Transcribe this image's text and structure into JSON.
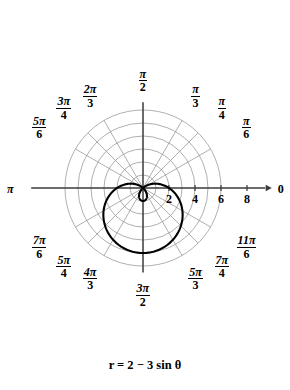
{
  "figure": {
    "caption": "r = 2 − 3 sin θ",
    "axis_right_label": "0",
    "axis_left_label": "π"
  },
  "radial_ticks": [
    {
      "value": 2,
      "label": "2"
    },
    {
      "value": 4,
      "label": "4"
    },
    {
      "value": 6,
      "label": "6"
    },
    {
      "value": 8,
      "label": "8"
    }
  ],
  "angle_labels": [
    {
      "id": "pi-over-2",
      "num": "π",
      "den": "2",
      "degrees": 90
    },
    {
      "id": "two-pi-over-3",
      "num": "2π",
      "den": "3",
      "degrees": 120
    },
    {
      "id": "three-pi-over-4",
      "num": "3π",
      "den": "4",
      "degrees": 135
    },
    {
      "id": "five-pi-over-6",
      "num": "5π",
      "den": "6",
      "degrees": 150
    },
    {
      "id": "pi",
      "num": "π",
      "den": "",
      "degrees": 180
    },
    {
      "id": "seven-pi-over-6",
      "num": "7π",
      "den": "6",
      "degrees": 210
    },
    {
      "id": "five-pi-over-4",
      "num": "5π",
      "den": "4",
      "degrees": 225
    },
    {
      "id": "four-pi-over-3",
      "num": "4π",
      "den": "3",
      "degrees": 240
    },
    {
      "id": "three-pi-over-2",
      "num": "3π",
      "den": "2",
      "degrees": 270
    },
    {
      "id": "five-pi-over-3",
      "num": "5π",
      "den": "3",
      "degrees": 300
    },
    {
      "id": "seven-pi-over-4",
      "num": "7π",
      "den": "4",
      "degrees": 315
    },
    {
      "id": "eleven-pi-over-6",
      "num": "11π",
      "den": "6",
      "degrees": 330
    },
    {
      "id": "pi-over-6",
      "num": "π",
      "den": "6",
      "degrees": 30
    },
    {
      "id": "pi-over-4",
      "num": "π",
      "den": "4",
      "degrees": 45
    },
    {
      "id": "pi-over-3",
      "num": "π",
      "den": "3",
      "degrees": 60
    },
    {
      "id": "zero",
      "num": "0",
      "den": "",
      "degrees": 0
    }
  ],
  "colors": {
    "curve": "#000000",
    "axis": "#3a3a3a",
    "grid": "#9a9a9a",
    "background": "#ffffff",
    "text": "#000000"
  },
  "chart_data": {
    "type": "line",
    "plot_kind": "polar",
    "title": "",
    "equation": "r = 2 - 3 sin(theta)",
    "curve_name": "limacon with inner loop",
    "xlabel": "",
    "ylabel": "",
    "theta_unit": "radians",
    "theta_range": [
      0,
      6.283185307179586
    ],
    "r_axis_ticks": [
      2,
      4,
      6,
      8
    ],
    "r_max_grid": 6,
    "grid": true,
    "grid_circles": [
      1,
      2,
      3,
      4,
      5,
      6
    ],
    "grid_rays_degrees": [
      0,
      30,
      45,
      60,
      90,
      120,
      135,
      150,
      180,
      210,
      225,
      240,
      270,
      300,
      315,
      330
    ],
    "legend": "none",
    "pixels_per_unit": 13,
    "center_px": [
      143,
      188
    ],
    "key_points": [
      {
        "theta_deg": 0,
        "r": 2
      },
      {
        "theta_deg": 30,
        "r": 0.5
      },
      {
        "theta_deg": 45,
        "r": -0.121
      },
      {
        "theta_deg": 60,
        "r": -0.598
      },
      {
        "theta_deg": 90,
        "r": -1
      },
      {
        "theta_deg": 120,
        "r": -0.598
      },
      {
        "theta_deg": 135,
        "r": -0.121
      },
      {
        "theta_deg": 150,
        "r": 0.5
      },
      {
        "theta_deg": 180,
        "r": 2
      },
      {
        "theta_deg": 210,
        "r": 3.5
      },
      {
        "theta_deg": 225,
        "r": 4.121
      },
      {
        "theta_deg": 240,
        "r": 4.598
      },
      {
        "theta_deg": 270,
        "r": 5
      },
      {
        "theta_deg": 300,
        "r": 4.598
      },
      {
        "theta_deg": 315,
        "r": 4.121
      },
      {
        "theta_deg": 330,
        "r": 3.5
      }
    ],
    "series": [
      {
        "name": "r = 2 - 3 sin(theta)",
        "theta_deg": [
          0,
          10,
          20,
          30,
          40,
          50,
          60,
          70,
          80,
          90,
          100,
          110,
          120,
          130,
          140,
          150,
          160,
          170,
          180,
          190,
          200,
          210,
          220,
          230,
          240,
          250,
          260,
          270,
          280,
          290,
          300,
          310,
          320,
          330,
          340,
          350,
          360
        ],
        "r": [
          2,
          1.479,
          0.974,
          0.5,
          0.072,
          -0.298,
          -0.598,
          -0.819,
          -0.954,
          -1,
          -0.954,
          -0.819,
          -0.598,
          -0.298,
          0.072,
          0.5,
          0.974,
          1.479,
          2,
          2.521,
          3.026,
          3.5,
          3.928,
          4.298,
          4.598,
          4.819,
          4.954,
          5,
          4.954,
          4.819,
          4.598,
          4.298,
          3.928,
          3.5,
          3.026,
          2.521,
          2
        ]
      }
    ]
  }
}
